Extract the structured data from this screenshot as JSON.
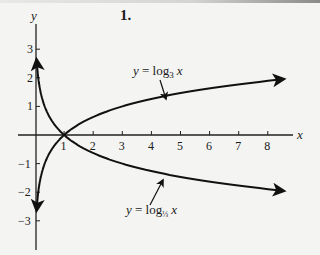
{
  "problem_number": "1.",
  "chart_data": {
    "type": "line",
    "title": "",
    "xlabel": "x",
    "ylabel": "y",
    "xlim": [
      0,
      9
    ],
    "ylim": [
      -3.7,
      3.7
    ],
    "grid": false,
    "x_ticks": [
      "1",
      "2",
      "3",
      "4",
      "5",
      "6",
      "7",
      "8"
    ],
    "y_ticks": [
      "3",
      "2",
      "1",
      "−1",
      "−2",
      "−3"
    ],
    "series": [
      {
        "name": "y = log_3 x",
        "label_main": "y = log",
        "label_sub": "3",
        "label_var": "x",
        "x": [
          0.05,
          0.1,
          0.2,
          0.33,
          0.5,
          1,
          2,
          3,
          4,
          5,
          6,
          7,
          8
        ],
        "values": [
          -2.73,
          -2.1,
          -1.46,
          -1.0,
          -0.63,
          0,
          0.63,
          1.0,
          1.26,
          1.46,
          1.63,
          1.77,
          1.89
        ]
      },
      {
        "name": "y = log_(1/3) x",
        "label_main": "y = log",
        "label_sub": "1/3",
        "label_var": "x",
        "x": [
          0.05,
          0.1,
          0.2,
          0.33,
          0.5,
          1,
          2,
          3,
          4,
          5,
          6,
          7,
          8
        ],
        "values": [
          2.73,
          2.1,
          1.46,
          1.0,
          0.63,
          0,
          -0.63,
          -1.0,
          -1.26,
          -1.46,
          -1.63,
          -1.77,
          -1.89
        ]
      }
    ],
    "colors": {
      "curve": "#111111",
      "axis": "#222222",
      "background": "#f4f4f2"
    }
  }
}
